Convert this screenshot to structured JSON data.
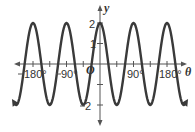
{
  "chart_data": {
    "type": "line",
    "title": "",
    "function": "y = 2 cos 4θ",
    "xlabel": "θ",
    "ylabel": "y",
    "origin_label": "O",
    "xlim": [
      -240,
      245
    ],
    "ylim": [
      -2.6,
      2.6
    ],
    "x_ticks": [
      -180,
      -135,
      -90,
      -45,
      45,
      90,
      135,
      180
    ],
    "x_tick_labels": [
      "-180°",
      "-90°",
      "90°",
      "180°"
    ],
    "x_tick_label_values": [
      -180,
      -90,
      90,
      180
    ],
    "y_ticks": [
      -2,
      -1,
      1,
      2
    ],
    "y_tick_labels": [
      "2",
      "1",
      "2"
    ],
    "y_tick_label_values": [
      2,
      1,
      -2
    ],
    "grid": false,
    "series": [
      {
        "name": "y = 2cos(4θ)",
        "amplitude": 2,
        "period_deg": 90,
        "color": "#3a3a3a",
        "peaks_x": [
          -180,
          -90,
          0,
          90,
          180
        ],
        "troughs_x": [
          -225,
          -135,
          -45,
          45,
          135,
          225
        ],
        "x": [
          -225,
          -180,
          -135,
          -90,
          -45,
          0,
          45,
          90,
          135,
          180,
          225
        ],
        "y": [
          -2,
          2,
          -2,
          2,
          -2,
          2,
          -2,
          2,
          -2,
          2,
          -2
        ]
      }
    ]
  },
  "labels": {
    "x_axis": "θ",
    "y_axis": "y",
    "origin": "O",
    "x_neg180": "180°",
    "x_neg90": "90°",
    "x_90": "90°",
    "x_180": "180°",
    "y_2": "2",
    "y_1": "1",
    "y_neg2": "2"
  }
}
